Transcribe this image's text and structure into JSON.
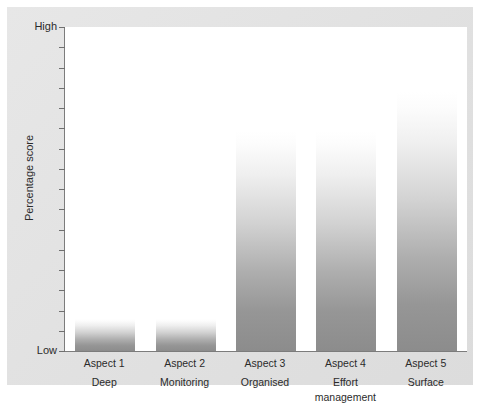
{
  "chart_data": {
    "type": "bar",
    "title": "",
    "xlabel": "",
    "ylabel": "Percentage score",
    "categories": [
      "Aspect 1",
      "Aspect 2",
      "Aspect 3",
      "Aspect 4",
      "Aspect 5"
    ],
    "category_subtitles": [
      "Deep",
      "Monitoring",
      "Organised",
      "Effort management",
      "Surface"
    ],
    "values": [
      10,
      10,
      68,
      68,
      80
    ],
    "ylim": [
      0,
      100
    ],
    "ytick_labels": [
      "Low",
      "High"
    ],
    "ytick_low": "Low",
    "ytick_high": "High",
    "ytick_count": 17,
    "grid": false,
    "legend": false,
    "bar_style": {
      "gradient_top": "#ffffff",
      "gradient_bottom": "#8c8c8c"
    },
    "axis_color": "#7c7c7c",
    "panel_color": "#e3e3e3",
    "plot_background": "#ffffff"
  },
  "bars": [
    {
      "label": "Aspect 1",
      "sub": "Deep",
      "value": 10
    },
    {
      "label": "Aspect 2",
      "sub": "Monitoring",
      "value": 10
    },
    {
      "label": "Aspect 3",
      "sub": "Organised",
      "value": 68
    },
    {
      "label": "Aspect 4",
      "sub": "Effort management",
      "value": 68
    },
    {
      "label": "Aspect 5",
      "sub": "Surface",
      "value": 80
    }
  ]
}
